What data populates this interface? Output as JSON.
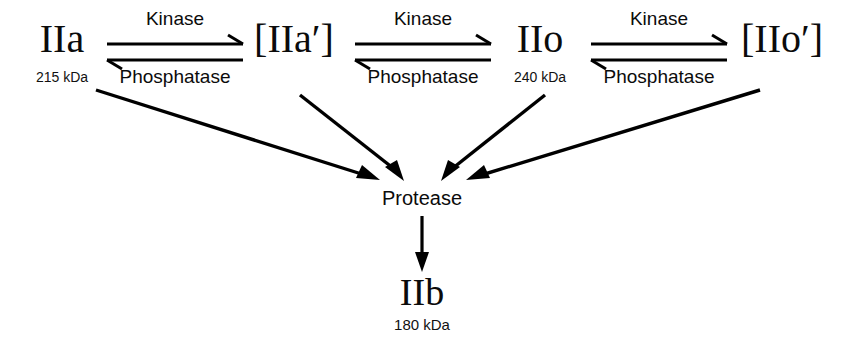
{
  "diagram": {
    "background_color": "#ffffff",
    "stroke_color": "#000000",
    "text_color": "#0b0b0b"
  },
  "species": [
    {
      "id": "IIa",
      "label": "IIa",
      "mass": "215 kDa",
      "x": 62,
      "y": 52,
      "mass_y": 82
    },
    {
      "id": "IIap",
      "label": "[IIa′]",
      "mass": "",
      "x": 294,
      "y": 52,
      "mass_y": 82
    },
    {
      "id": "IIo",
      "label": "IIo",
      "mass": "240 kDa",
      "x": 540,
      "y": 52,
      "mass_y": 82
    },
    {
      "id": "IIop",
      "label": "[IIo′]",
      "mass": "",
      "x": 782,
      "y": 52,
      "mass_y": 82
    }
  ],
  "product": {
    "id": "IIb",
    "label": "IIb",
    "mass": "180  kDa",
    "x": 422,
    "y": 305,
    "mass_y": 330
  },
  "protease_node": {
    "label": "Protease",
    "x": 422,
    "y": 205
  },
  "reactions": [
    {
      "id": "rxn-1",
      "forward_label": "Kinase",
      "reverse_label": "Phosphatase",
      "from": "IIa",
      "to": "[IIa′]",
      "x1": 107,
      "x2": 243,
      "forward_y": 44,
      "reverse_y": 60,
      "forward_label_y": 25,
      "reverse_label_y": 83
    },
    {
      "id": "rxn-2",
      "forward_label": "Kinase",
      "reverse_label": "Phosphatase",
      "from": "[IIa′]",
      "to": "IIo",
      "x1": 355,
      "x2": 491,
      "forward_y": 44,
      "reverse_y": 60,
      "forward_label_y": 25,
      "reverse_label_y": 83
    },
    {
      "id": "rxn-3",
      "forward_label": "Kinase",
      "reverse_label": "Phosphatase",
      "from": "IIo",
      "to": "[IIo′]",
      "x1": 591,
      "x2": 727,
      "forward_y": 44,
      "reverse_y": 60,
      "forward_label_y": 25,
      "reverse_label_y": 83
    }
  ],
  "converging_arrows": [
    {
      "id": "conv-IIa",
      "source": "IIa",
      "x1": 96,
      "y1": 90,
      "x2": 378,
      "y2": 180
    },
    {
      "id": "conv-IIap",
      "source": "[IIa′]",
      "x1": 300,
      "y1": 95,
      "x2": 402,
      "y2": 180
    },
    {
      "id": "conv-IIo",
      "source": "IIo",
      "x1": 545,
      "y1": 95,
      "x2": 444,
      "y2": 180
    },
    {
      "id": "conv-IIop",
      "source": "[IIo′]",
      "x1": 760,
      "y1": 90,
      "x2": 466,
      "y2": 180
    }
  ],
  "protease_to_product_arrow": {
    "id": "protease-to-IIb",
    "x": 422,
    "y1": 216,
    "y2": 270
  },
  "legend_notes": {
    "forward_enzyme": "Kinase",
    "reverse_enzyme": "Phosphatase",
    "cleavage_enzyme": "Protease"
  }
}
